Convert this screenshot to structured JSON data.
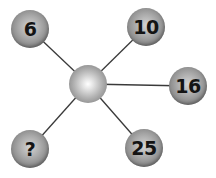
{
  "puzzle": {
    "hub": {
      "cx": 88,
      "cy": 84
    },
    "nodes": [
      {
        "label": "6",
        "cx": 30,
        "cy": 29
      },
      {
        "label": "10",
        "cx": 146,
        "cy": 27
      },
      {
        "label": "16",
        "cx": 188,
        "cy": 86
      },
      {
        "label": "?",
        "cx": 30,
        "cy": 149
      },
      {
        "label": "25",
        "cx": 144,
        "cy": 148
      }
    ],
    "colors": {
      "line": "#3a3a3a",
      "ball_dark": "#606060",
      "ball_light": "#d4d4d4",
      "text": "#141414"
    }
  }
}
